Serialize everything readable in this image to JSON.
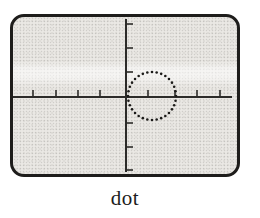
{
  "figure": {
    "caption": "dot",
    "screen": {
      "bezel_color": "#1e1d1b",
      "bg_color": "#eae8e4",
      "axis_color": "#2c2b29",
      "trace_color": "#1c1b19",
      "axes": {
        "h_y": 80,
        "h_x1": 0,
        "h_x2": 219,
        "v_x": 113,
        "v_y1": 2,
        "v_y2": 155
      },
      "tick_len": 7,
      "h_ticks": [
        20,
        43,
        65,
        87,
        135,
        162,
        184,
        207
      ],
      "v_ticks": [
        7,
        31,
        55,
        106,
        130,
        153
      ],
      "trace_circle": {
        "cx": 139,
        "cy": 79,
        "r": 24,
        "dot_count": 32,
        "dot_radius": 1.3
      }
    }
  }
}
